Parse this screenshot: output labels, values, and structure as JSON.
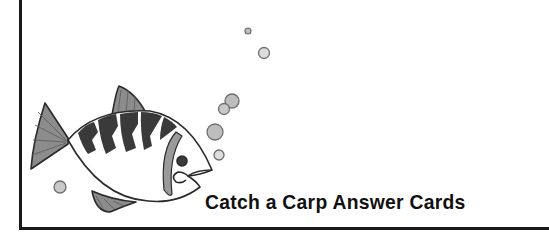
{
  "card": {
    "title": "Catch a Carp Answer Cards",
    "illustration": "fish-icon",
    "colors": {
      "border": "#1a1a1a",
      "fin_fill": "#8c8c8c",
      "stripe_fill": "#3a3a3a",
      "bubble_fill": "#c8c8c8",
      "bubble_stroke": "#6e6e6e"
    }
  }
}
